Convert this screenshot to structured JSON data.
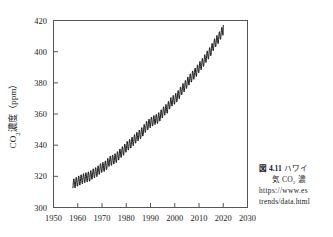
{
  "figure": {
    "caption_number": "図 4.11",
    "caption_line1_text": "ハワイ",
    "caption_line2_text": "気 CO₂ 濃",
    "caption_url_line1": "https://www.es",
    "caption_url_line2": "trends/data.html"
  },
  "chart_data": {
    "type": "line",
    "title": "",
    "subtitle": "",
    "xlabel": "",
    "ylabel": "CO₂濃度（ppm）",
    "ylabel_parts": {
      "species": "CO",
      "subscript": "2",
      "rest": "濃度（ppm）"
    },
    "xlim": [
      1950,
      2030
    ],
    "ylim": [
      300,
      420
    ],
    "xticks": [
      1950,
      1960,
      1970,
      1980,
      1990,
      2000,
      2010,
      2020,
      2030
    ],
    "yticks": [
      300,
      320,
      340,
      360,
      380,
      400,
      420
    ],
    "xtick_labels": [
      "1950",
      "1960",
      "1970",
      "1980",
      "1990",
      "2000",
      "2010",
      "2020",
      "2030"
    ],
    "ytick_labels": [
      "300",
      "320",
      "340",
      "360",
      "380",
      "400",
      "420"
    ],
    "grid": false,
    "legend": null,
    "legend_position": "none",
    "line_color": "#111111",
    "frame_color": "#555555",
    "background": "#ffffff",
    "series": [
      {
        "name": "Mauna Loa monthly mean CO2 (ppm)",
        "description": "Keeling curve: rising trend with annual sawtooth oscillation of about 6 ppm peak-to-peak",
        "seasonal_amplitude_ppm": 3.2,
        "x": [
          1958,
          1959,
          1960,
          1961,
          1962,
          1963,
          1964,
          1965,
          1966,
          1967,
          1968,
          1969,
          1970,
          1971,
          1972,
          1973,
          1974,
          1975,
          1976,
          1977,
          1978,
          1979,
          1980,
          1981,
          1982,
          1983,
          1984,
          1985,
          1986,
          1987,
          1988,
          1989,
          1990,
          1991,
          1992,
          1993,
          1994,
          1995,
          1996,
          1997,
          1998,
          1999,
          2000,
          2001,
          2002,
          2003,
          2004,
          2005,
          2006,
          2007,
          2008,
          2009,
          2010,
          2011,
          2012,
          2013,
          2014,
          2015,
          2016,
          2017,
          2018,
          2019,
          2020
        ],
        "values": [
          315.0,
          315.8,
          316.9,
          317.6,
          318.4,
          319.0,
          319.6,
          320.0,
          321.4,
          322.2,
          323.0,
          324.6,
          325.7,
          326.3,
          327.5,
          329.7,
          330.2,
          331.1,
          332.0,
          333.8,
          335.4,
          336.8,
          338.8,
          340.1,
          341.4,
          343.0,
          344.6,
          346.0,
          347.4,
          349.2,
          351.6,
          353.1,
          354.4,
          355.6,
          356.4,
          357.1,
          358.8,
          360.8,
          362.6,
          363.7,
          366.7,
          368.4,
          369.5,
          371.1,
          373.2,
          375.8,
          377.5,
          379.8,
          381.9,
          383.8,
          385.6,
          387.4,
          389.9,
          391.7,
          393.9,
          396.5,
          398.6,
          400.8,
          404.2,
          406.5,
          408.5,
          411.4,
          414.0
        ]
      }
    ]
  },
  "axes": {
    "tick_direction": "inward",
    "minor_ticks": false
  }
}
